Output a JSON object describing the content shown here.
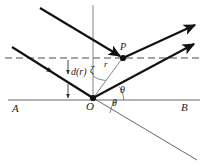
{
  "figure": {
    "type": "optics-scattering-diagram",
    "colors": {
      "ray_stroke": "#111111",
      "thin_stroke": "#555555",
      "axis_stroke": "#666666",
      "dashed_stroke": "#555555",
      "text": "#1a1a1a",
      "background": "#ffffff"
    },
    "labels": {
      "left_axis_end": "A",
      "right_axis_end": "B",
      "origin": "O",
      "point_p": "P",
      "impact_parameter": "d(r)",
      "zeta_angle": "ζ",
      "radius": "r",
      "theta_upper": "θ",
      "theta_lower": "θ"
    },
    "geometry": {
      "origin": [
        93,
        98
      ],
      "point_p": [
        123,
        58
      ],
      "axis_line": {
        "x1": 8,
        "y1": 100,
        "x2": 200,
        "y2": 100
      },
      "dashed_line": {
        "x1": 5,
        "y1": 58,
        "x2": 200,
        "y2": 58
      },
      "vertical_line": {
        "x1": 93,
        "y1": 5,
        "x2": 93,
        "y2": 98
      },
      "incident_upper": {
        "x1": 40,
        "y1": 8,
        "x2": 123,
        "y2": 58
      },
      "incident_lower": {
        "x1": 12,
        "y1": 47,
        "x2": 93,
        "y2": 98
      },
      "outgoing_from_p": {
        "x1": 123,
        "y1": 58,
        "x2": 197,
        "y2": 24
      },
      "outgoing_from_o": {
        "x1": 93,
        "y1": 98,
        "x2": 197,
        "y2": 43
      },
      "extension_line": {
        "x1": 93,
        "y1": 98,
        "x2": 197,
        "y2": 160
      },
      "d_arrow": {
        "x": 68,
        "y1": 58,
        "y2": 98
      }
    }
  }
}
